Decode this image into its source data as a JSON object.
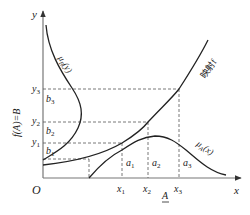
{
  "diagram": {
    "colors": {
      "line": "#222222",
      "dashed": "#555555",
      "background": "#ffffff"
    },
    "axes": {
      "origin_label": "O",
      "x_label": "x",
      "y_label": "y",
      "x_axis_caption": "A",
      "y_axis_caption": "f(A)=B"
    },
    "x_ticks": [
      "x",
      "x",
      "x"
    ],
    "x_tick_subs": [
      "1",
      "2",
      "3"
    ],
    "y_ticks": [
      "y",
      "y",
      "y"
    ],
    "y_tick_subs": [
      "1",
      "2",
      "3"
    ],
    "a_labels": [
      "a",
      "a",
      "a"
    ],
    "a_subs": [
      "1",
      "2",
      "3"
    ],
    "b_labels": [
      "b",
      "b",
      "b"
    ],
    "b_subs": [
      "1",
      "2",
      "3"
    ],
    "curves": {
      "mapping": {
        "label": "映射f"
      },
      "mu_A": {
        "label_main": "μ",
        "label_sub": "A",
        "label_arg": "(x)"
      },
      "mu_B": {
        "label_main": "μ",
        "label_sub": "B",
        "label_arg": "(y)"
      }
    }
  }
}
